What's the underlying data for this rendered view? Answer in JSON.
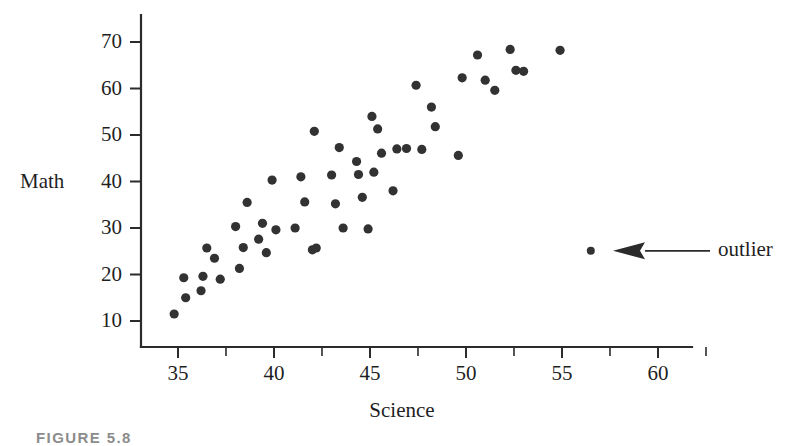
{
  "figure": {
    "caption": "FIGURE 5.8",
    "background_color": "#ffffff",
    "ink_color": "#2b2b2b",
    "point_color": "#323232"
  },
  "chart_data": {
    "type": "scatter",
    "title": "",
    "xlabel": "Science",
    "ylabel": "Math",
    "xlim": [
      32.5,
      62.5
    ],
    "ylim": [
      5,
      75
    ],
    "grid": false,
    "legend": "none",
    "xticks": [
      35,
      40,
      45,
      50,
      55,
      60
    ],
    "xtick_labels": [
      "35",
      "40",
      "45",
      "50",
      "55",
      "60"
    ],
    "xminor_ticks": [
      37.5,
      42.5,
      47.5,
      52.5,
      57.5,
      62.5
    ],
    "yticks": [
      10,
      20,
      30,
      40,
      50,
      60,
      70
    ],
    "ytick_labels": [
      "10",
      "20",
      "30",
      "40",
      "50",
      "60",
      "70"
    ],
    "series": [
      {
        "name": "students",
        "marker": "filled-circle",
        "points": [
          [
            34.8,
            11.5
          ],
          [
            35.3,
            19.3
          ],
          [
            35.4,
            15.0
          ],
          [
            36.2,
            16.5
          ],
          [
            36.3,
            19.6
          ],
          [
            36.5,
            25.7
          ],
          [
            36.9,
            23.5
          ],
          [
            37.2,
            19.0
          ],
          [
            38.0,
            30.3
          ],
          [
            38.2,
            21.3
          ],
          [
            38.4,
            25.8
          ],
          [
            38.6,
            35.5
          ],
          [
            39.2,
            27.6
          ],
          [
            39.4,
            31.0
          ],
          [
            39.6,
            24.7
          ],
          [
            39.9,
            40.3
          ],
          [
            40.1,
            29.6
          ],
          [
            41.1,
            30.0
          ],
          [
            41.4,
            41.0
          ],
          [
            41.6,
            35.6
          ],
          [
            42.0,
            25.3
          ],
          [
            42.1,
            50.8
          ],
          [
            42.2,
            25.7
          ],
          [
            43.0,
            41.4
          ],
          [
            43.2,
            35.2
          ],
          [
            43.4,
            47.3
          ],
          [
            43.6,
            30.0
          ],
          [
            44.3,
            44.3
          ],
          [
            44.4,
            41.5
          ],
          [
            44.6,
            36.6
          ],
          [
            44.9,
            29.8
          ],
          [
            45.1,
            54.0
          ],
          [
            45.2,
            42.0
          ],
          [
            45.4,
            51.3
          ],
          [
            45.6,
            46.1
          ],
          [
            46.2,
            38.0
          ],
          [
            46.4,
            47.0
          ],
          [
            46.9,
            47.1
          ],
          [
            47.4,
            60.7
          ],
          [
            47.7,
            46.9
          ],
          [
            48.2,
            56.0
          ],
          [
            48.4,
            51.8
          ],
          [
            49.6,
            45.6
          ],
          [
            49.8,
            62.3
          ],
          [
            50.6,
            67.2
          ],
          [
            51.0,
            61.8
          ],
          [
            51.5,
            59.6
          ],
          [
            52.3,
            68.4
          ],
          [
            52.6,
            63.9
          ],
          [
            53.0,
            63.7
          ],
          [
            54.9,
            68.2
          ]
        ]
      }
    ],
    "outlier": {
      "label": "outlier",
      "point": [
        56.5,
        25.1
      ],
      "annotation_type": "arrow"
    }
  }
}
